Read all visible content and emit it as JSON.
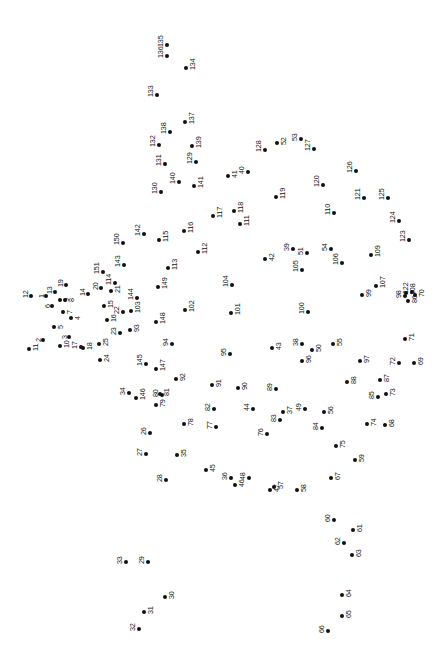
{
  "puzzle": {
    "type": "connect-the-dots",
    "title": "",
    "width": 447,
    "height": 658,
    "background_color": "#ffffff",
    "dot_color": "#111111",
    "label_color": "#111111",
    "label_rotation_degrees": -90,
    "dot_radius_px": 2.1,
    "label_font_size_px": 7.2,
    "dot_count": 151,
    "dots": [
      {
        "n": "1",
        "x": 46,
        "y": 296,
        "lx": -8,
        "ly": 2
      },
      {
        "n": "2",
        "x": 43,
        "y": 340,
        "lx": -8,
        "ly": 2
      },
      {
        "n": "3",
        "x": 69,
        "y": 337,
        "lx": -8,
        "ly": 2
      },
      {
        "n": "4",
        "x": 71,
        "y": 318,
        "lx": 3,
        "ly": 2
      },
      {
        "n": "5",
        "x": 54,
        "y": 327,
        "lx": 3,
        "ly": 2
      },
      {
        "n": "6",
        "x": 52,
        "y": 306,
        "lx": -8,
        "ly": 2
      },
      {
        "n": "7",
        "x": 63,
        "y": 312,
        "lx": 3,
        "ly": 2
      },
      {
        "n": "8",
        "x": 65,
        "y": 300,
        "lx": 3,
        "ly": 2
      },
      {
        "n": "9",
        "x": 60,
        "y": 300,
        "lx": 3,
        "ly": 2
      },
      {
        "n": "10",
        "x": 60,
        "y": 346,
        "lx": 3,
        "ly": 2
      },
      {
        "n": "11",
        "x": 29,
        "y": 349,
        "lx": 3,
        "ly": 2
      },
      {
        "n": "12",
        "x": 31,
        "y": 296,
        "lx": -9,
        "ly": 2
      },
      {
        "n": "13",
        "x": 55,
        "y": 292,
        "lx": -9,
        "ly": 2
      },
      {
        "n": "14",
        "x": 88,
        "y": 294,
        "lx": -9,
        "ly": 2
      },
      {
        "n": "15",
        "x": 104,
        "y": 306,
        "lx": 3,
        "ly": 2
      },
      {
        "n": "16",
        "x": 107,
        "y": 320,
        "lx": 3,
        "ly": 2
      },
      {
        "n": "17",
        "x": 81,
        "y": 347,
        "lx": -10,
        "ly": 2
      },
      {
        "n": "18",
        "x": 83,
        "y": 348,
        "lx": 3,
        "ly": 2
      },
      {
        "n": "19",
        "x": 66,
        "y": 285,
        "lx": -9,
        "ly": 2
      },
      {
        "n": "20",
        "x": 101,
        "y": 288,
        "lx": -9,
        "ly": 2
      },
      {
        "n": "21",
        "x": 111,
        "y": 291,
        "lx": 3,
        "ly": 2
      },
      {
        "n": "22",
        "x": 123,
        "y": 312,
        "lx": -10,
        "ly": 2
      },
      {
        "n": "23",
        "x": 120,
        "y": 333,
        "lx": -10,
        "ly": 2
      },
      {
        "n": "24",
        "x": 100,
        "y": 360,
        "lx": 3,
        "ly": 2
      },
      {
        "n": "25",
        "x": 99,
        "y": 344,
        "lx": 3,
        "ly": 2
      },
      {
        "n": "26",
        "x": 150,
        "y": 433,
        "lx": -10,
        "ly": 2
      },
      {
        "n": "27",
        "x": 146,
        "y": 454,
        "lx": -10,
        "ly": 2
      },
      {
        "n": "28",
        "x": 166,
        "y": 480,
        "lx": -10,
        "ly": 2
      },
      {
        "n": "29",
        "x": 148,
        "y": 562,
        "lx": -10,
        "ly": 2
      },
      {
        "n": "30",
        "x": 165,
        "y": 597,
        "lx": 3,
        "ly": 2
      },
      {
        "n": "31",
        "x": 144,
        "y": 612,
        "lx": 3,
        "ly": 2
      },
      {
        "n": "32",
        "x": 139,
        "y": 629,
        "lx": -10,
        "ly": 2
      },
      {
        "n": "33",
        "x": 126,
        "y": 562,
        "lx": -10,
        "ly": 2
      },
      {
        "n": "34",
        "x": 129,
        "y": 393,
        "lx": -10,
        "ly": 2
      },
      {
        "n": "35",
        "x": 177,
        "y": 455,
        "lx": 3,
        "ly": 2
      },
      {
        "n": "36",
        "x": 231,
        "y": 478,
        "lx": -10,
        "ly": 2
      },
      {
        "n": "37",
        "x": 283,
        "y": 412,
        "lx": 3,
        "ly": 2
      },
      {
        "n": "38",
        "x": 302,
        "y": 344,
        "lx": -10,
        "ly": 2
      },
      {
        "n": "39",
        "x": 293,
        "y": 249,
        "lx": -10,
        "ly": 2
      },
      {
        "n": "40",
        "x": 248,
        "y": 172,
        "lx": -10,
        "ly": 2
      },
      {
        "n": "41",
        "x": 228,
        "y": 176,
        "lx": 3,
        "ly": 2
      },
      {
        "n": "42",
        "x": 265,
        "y": 259,
        "lx": 3,
        "ly": 2
      },
      {
        "n": "43",
        "x": 272,
        "y": 348,
        "lx": 3,
        "ly": 2
      },
      {
        "n": "44",
        "x": 253,
        "y": 409,
        "lx": -10,
        "ly": 2
      },
      {
        "n": "45",
        "x": 206,
        "y": 470,
        "lx": 3,
        "ly": 2
      },
      {
        "n": "46",
        "x": 235,
        "y": 485,
        "lx": 3,
        "ly": 2
      },
      {
        "n": "47",
        "x": 270,
        "y": 490,
        "lx": 3,
        "ly": 2
      },
      {
        "n": "48",
        "x": 249,
        "y": 478,
        "lx": -10,
        "ly": 2
      },
      {
        "n": "49",
        "x": 305,
        "y": 409,
        "lx": -10,
        "ly": 2
      },
      {
        "n": "50",
        "x": 312,
        "y": 350,
        "lx": 3,
        "ly": 2
      },
      {
        "n": "51",
        "x": 307,
        "y": 253,
        "lx": -10,
        "ly": 2
      },
      {
        "n": "52",
        "x": 277,
        "y": 143,
        "lx": 3,
        "ly": 2
      },
      {
        "n": "53",
        "x": 301,
        "y": 139,
        "lx": -10,
        "ly": 2
      },
      {
        "n": "54",
        "x": 331,
        "y": 249,
        "lx": -10,
        "ly": 2
      },
      {
        "n": "55",
        "x": 333,
        "y": 344,
        "lx": 3,
        "ly": 2
      },
      {
        "n": "56",
        "x": 324,
        "y": 412,
        "lx": 3,
        "ly": 2
      },
      {
        "n": "57",
        "x": 274,
        "y": 487,
        "lx": 3,
        "ly": 2
      },
      {
        "n": "58",
        "x": 297,
        "y": 490,
        "lx": 3,
        "ly": 2
      },
      {
        "n": "59",
        "x": 355,
        "y": 460,
        "lx": 3,
        "ly": 2
      },
      {
        "n": "60",
        "x": 334,
        "y": 520,
        "lx": -10,
        "ly": 2
      },
      {
        "n": "61",
        "x": 353,
        "y": 530,
        "lx": 3,
        "ly": 2
      },
      {
        "n": "62",
        "x": 344,
        "y": 543,
        "lx": -10,
        "ly": 2
      },
      {
        "n": "63",
        "x": 352,
        "y": 555,
        "lx": 3,
        "ly": 2
      },
      {
        "n": "64",
        "x": 342,
        "y": 595,
        "lx": 3,
        "ly": 2
      },
      {
        "n": "65",
        "x": 342,
        "y": 616,
        "lx": 3,
        "ly": 2
      },
      {
        "n": "66",
        "x": 328,
        "y": 631,
        "lx": -10,
        "ly": 2
      },
      {
        "n": "67",
        "x": 331,
        "y": 478,
        "lx": 3,
        "ly": 2
      },
      {
        "n": "68",
        "x": 385,
        "y": 425,
        "lx": 3,
        "ly": 2
      },
      {
        "n": "69",
        "x": 414,
        "y": 363,
        "lx": 3,
        "ly": 2
      },
      {
        "n": "70",
        "x": 415,
        "y": 295,
        "lx": 3,
        "ly": 2
      },
      {
        "n": "71",
        "x": 405,
        "y": 339,
        "lx": 3,
        "ly": 2
      },
      {
        "n": "72",
        "x": 399,
        "y": 363,
        "lx": -10,
        "ly": 2
      },
      {
        "n": "73",
        "x": 386,
        "y": 394,
        "lx": 3,
        "ly": 2
      },
      {
        "n": "74",
        "x": 367,
        "y": 424,
        "lx": 3,
        "ly": 2
      },
      {
        "n": "75",
        "x": 336,
        "y": 446,
        "lx": 3,
        "ly": 2
      },
      {
        "n": "76",
        "x": 267,
        "y": 434,
        "lx": -10,
        "ly": 2
      },
      {
        "n": "77",
        "x": 216,
        "y": 427,
        "lx": -10,
        "ly": 2
      },
      {
        "n": "78",
        "x": 184,
        "y": 424,
        "lx": 3,
        "ly": 2
      },
      {
        "n": "79",
        "x": 156,
        "y": 405,
        "lx": 3,
        "ly": 2
      },
      {
        "n": "80",
        "x": 162,
        "y": 395,
        "lx": -10,
        "ly": 2
      },
      {
        "n": "81",
        "x": 160,
        "y": 394,
        "lx": 3,
        "ly": 2
      },
      {
        "n": "82",
        "x": 214,
        "y": 409,
        "lx": -10,
        "ly": 2
      },
      {
        "n": "83",
        "x": 280,
        "y": 420,
        "lx": -10,
        "ly": 2
      },
      {
        "n": "84",
        "x": 322,
        "y": 428,
        "lx": -10,
        "ly": 2
      },
      {
        "n": "85",
        "x": 378,
        "y": 397,
        "lx": -10,
        "ly": 2
      },
      {
        "n": "86",
        "x": 408,
        "y": 301,
        "lx": 3,
        "ly": 2
      },
      {
        "n": "87",
        "x": 380,
        "y": 380,
        "lx": 3,
        "ly": 2
      },
      {
        "n": "88",
        "x": 347,
        "y": 382,
        "lx": 3,
        "ly": 2
      },
      {
        "n": "89",
        "x": 276,
        "y": 389,
        "lx": -10,
        "ly": 2
      },
      {
        "n": "90",
        "x": 238,
        "y": 388,
        "lx": 3,
        "ly": 2
      },
      {
        "n": "91",
        "x": 212,
        "y": 385,
        "lx": 3,
        "ly": 2
      },
      {
        "n": "92",
        "x": 176,
        "y": 379,
        "lx": 3,
        "ly": 2
      },
      {
        "n": "93",
        "x": 130,
        "y": 330,
        "lx": 3,
        "ly": 2
      },
      {
        "n": "94",
        "x": 172,
        "y": 344,
        "lx": -10,
        "ly": 2
      },
      {
        "n": "95",
        "x": 230,
        "y": 354,
        "lx": -10,
        "ly": 2
      },
      {
        "n": "96",
        "x": 302,
        "y": 361,
        "lx": 3,
        "ly": 2
      },
      {
        "n": "97",
        "x": 360,
        "y": 361,
        "lx": 3,
        "ly": 2
      },
      {
        "n": "98",
        "x": 405,
        "y": 296,
        "lx": -10,
        "ly": 2
      },
      {
        "n": "99",
        "x": 362,
        "y": 295,
        "lx": 3,
        "ly": 2
      },
      {
        "n": "100",
        "x": 308,
        "y": 312,
        "lx": -10,
        "ly": 2
      },
      {
        "n": "101",
        "x": 231,
        "y": 313,
        "lx": 3,
        "ly": 2
      },
      {
        "n": "102",
        "x": 185,
        "y": 310,
        "lx": 3,
        "ly": 2
      },
      {
        "n": "103",
        "x": 131,
        "y": 311,
        "lx": 3,
        "ly": 2
      },
      {
        "n": "104",
        "x": 232,
        "y": 285,
        "lx": -10,
        "ly": 2
      },
      {
        "n": "105",
        "x": 302,
        "y": 270,
        "lx": -10,
        "ly": 2
      },
      {
        "n": "106",
        "x": 342,
        "y": 263,
        "lx": -10,
        "ly": 2
      },
      {
        "n": "107",
        "x": 376,
        "y": 286,
        "lx": 3,
        "ly": 2
      },
      {
        "n": "108",
        "x": 406,
        "y": 293,
        "lx": 3,
        "ly": 2
      },
      {
        "n": "109",
        "x": 371,
        "y": 255,
        "lx": 3,
        "ly": 2
      },
      {
        "n": "110",
        "x": 334,
        "y": 213,
        "lx": -10,
        "ly": 2
      },
      {
        "n": "111",
        "x": 240,
        "y": 224,
        "lx": 3,
        "ly": 2
      },
      {
        "n": "112",
        "x": 198,
        "y": 252,
        "lx": 3,
        "ly": 2
      },
      {
        "n": "113",
        "x": 168,
        "y": 268,
        "lx": 3,
        "ly": 2
      },
      {
        "n": "114",
        "x": 115,
        "y": 283,
        "lx": -10,
        "ly": 2
      },
      {
        "n": "115",
        "x": 159,
        "y": 240,
        "lx": 3,
        "ly": 2
      },
      {
        "n": "116",
        "x": 184,
        "y": 231,
        "lx": 3,
        "ly": 2
      },
      {
        "n": "117",
        "x": 213,
        "y": 216,
        "lx": 3,
        "ly": 2
      },
      {
        "n": "118",
        "x": 234,
        "y": 211,
        "lx": 3,
        "ly": 2
      },
      {
        "n": "119",
        "x": 276,
        "y": 197,
        "lx": 3,
        "ly": 2
      },
      {
        "n": "120",
        "x": 323,
        "y": 185,
        "lx": -10,
        "ly": 2
      },
      {
        "n": "121",
        "x": 364,
        "y": 198,
        "lx": -10,
        "ly": 2
      },
      {
        "n": "122",
        "x": 412,
        "y": 292,
        "lx": -10,
        "ly": 2
      },
      {
        "n": "123",
        "x": 409,
        "y": 240,
        "lx": -10,
        "ly": 2
      },
      {
        "n": "124",
        "x": 399,
        "y": 221,
        "lx": -10,
        "ly": 2
      },
      {
        "n": "125",
        "x": 388,
        "y": 198,
        "lx": -10,
        "ly": 2
      },
      {
        "n": "126",
        "x": 356,
        "y": 171,
        "lx": -10,
        "ly": 2
      },
      {
        "n": "127",
        "x": 314,
        "y": 149,
        "lx": -10,
        "ly": 2
      },
      {
        "n": "128",
        "x": 265,
        "y": 150,
        "lx": -10,
        "ly": 2
      },
      {
        "n": "129",
        "x": 196,
        "y": 162,
        "lx": -10,
        "ly": 2
      },
      {
        "n": "130",
        "x": 161,
        "y": 192,
        "lx": -10,
        "ly": 2
      },
      {
        "n": "131",
        "x": 165,
        "y": 164,
        "lx": -10,
        "ly": 2
      },
      {
        "n": "132",
        "x": 159,
        "y": 145,
        "lx": -10,
        "ly": 2
      },
      {
        "n": "133",
        "x": 157,
        "y": 95,
        "lx": -10,
        "ly": 2
      },
      {
        "n": "134",
        "x": 186,
        "y": 68,
        "lx": 3,
        "ly": 2
      },
      {
        "n": "135",
        "x": 167,
        "y": 45,
        "lx": -10,
        "ly": 2
      },
      {
        "n": "136",
        "x": 167,
        "y": 56,
        "lx": -10,
        "ly": 2
      },
      {
        "n": "137",
        "x": 185,
        "y": 122,
        "lx": 3,
        "ly": 2
      },
      {
        "n": "138",
        "x": 170,
        "y": 132,
        "lx": -10,
        "ly": 2
      },
      {
        "n": "139",
        "x": 192,
        "y": 146,
        "lx": 3,
        "ly": 2
      },
      {
        "n": "140",
        "x": 179,
        "y": 182,
        "lx": -10,
        "ly": 2
      },
      {
        "n": "141",
        "x": 194,
        "y": 186,
        "lx": 3,
        "ly": 2
      },
      {
        "n": "142",
        "x": 144,
        "y": 234,
        "lx": -10,
        "ly": 2
      },
      {
        "n": "143",
        "x": 124,
        "y": 265,
        "lx": -10,
        "ly": 2
      },
      {
        "n": "144",
        "x": 137,
        "y": 298,
        "lx": -10,
        "ly": 2
      },
      {
        "n": "145",
        "x": 146,
        "y": 364,
        "lx": -10,
        "ly": 2
      },
      {
        "n": "146",
        "x": 136,
        "y": 398,
        "lx": 3,
        "ly": 2
      },
      {
        "n": "147",
        "x": 156,
        "y": 369,
        "lx": 3,
        "ly": 2
      },
      {
        "n": "148",
        "x": 156,
        "y": 322,
        "lx": 3,
        "ly": 2
      },
      {
        "n": "149",
        "x": 158,
        "y": 287,
        "lx": 3,
        "ly": 2
      },
      {
        "n": "150",
        "x": 123,
        "y": 243,
        "lx": -10,
        "ly": 2
      },
      {
        "n": "151",
        "x": 103,
        "y": 272,
        "lx": -10,
        "ly": 2
      }
    ]
  }
}
